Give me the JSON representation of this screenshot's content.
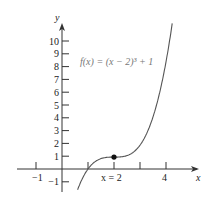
{
  "chart_data": {
    "type": "line",
    "title": "",
    "function_label": "f(x) = (x − 2)³ + 1",
    "xlabel": "x",
    "ylabel": "y",
    "x_ticks": [
      -1,
      1,
      2,
      3,
      4
    ],
    "x_tick_labels": [
      "−1",
      "x = 2",
      "4"
    ],
    "y_ticks": [
      -1,
      1,
      2,
      3,
      4,
      5,
      6,
      7,
      8,
      9,
      10
    ],
    "y_tick_labels": [
      "−1",
      "1",
      "2",
      "3",
      "4",
      "5",
      "6",
      "7",
      "8",
      "9",
      "10"
    ],
    "xlim": [
      -1.7,
      5.2
    ],
    "ylim": [
      -2,
      11.2
    ],
    "grid": false,
    "series": [
      {
        "name": "f(x) = (x − 2)³ + 1",
        "x": [
          0.6,
          1.0,
          1.5,
          2.0,
          2.5,
          3.0,
          3.5,
          4.0,
          4.23
        ],
        "values": [
          -1.74,
          0.0,
          0.875,
          1.0,
          1.125,
          2.0,
          4.375,
          9.0,
          12.1
        ]
      }
    ],
    "highlight_point": {
      "x": 2,
      "y": 1,
      "label": "x = 2"
    }
  },
  "labels": {
    "y_axis": "y",
    "x_axis": "x",
    "func": "f(x) = (x − 2)³ + 1",
    "xm1": "−1",
    "x2": "x = 2",
    "x4": "4"
  }
}
